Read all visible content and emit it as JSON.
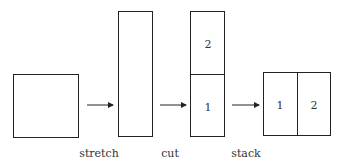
{
  "diagram": {
    "steps": [
      {
        "label": "stretch"
      },
      {
        "label": "cut"
      },
      {
        "label": "stack"
      }
    ],
    "cut_piece_labels": {
      "top": "2",
      "bottom": "1"
    },
    "stacked_piece_labels": {
      "left": "1",
      "right": "2"
    }
  }
}
